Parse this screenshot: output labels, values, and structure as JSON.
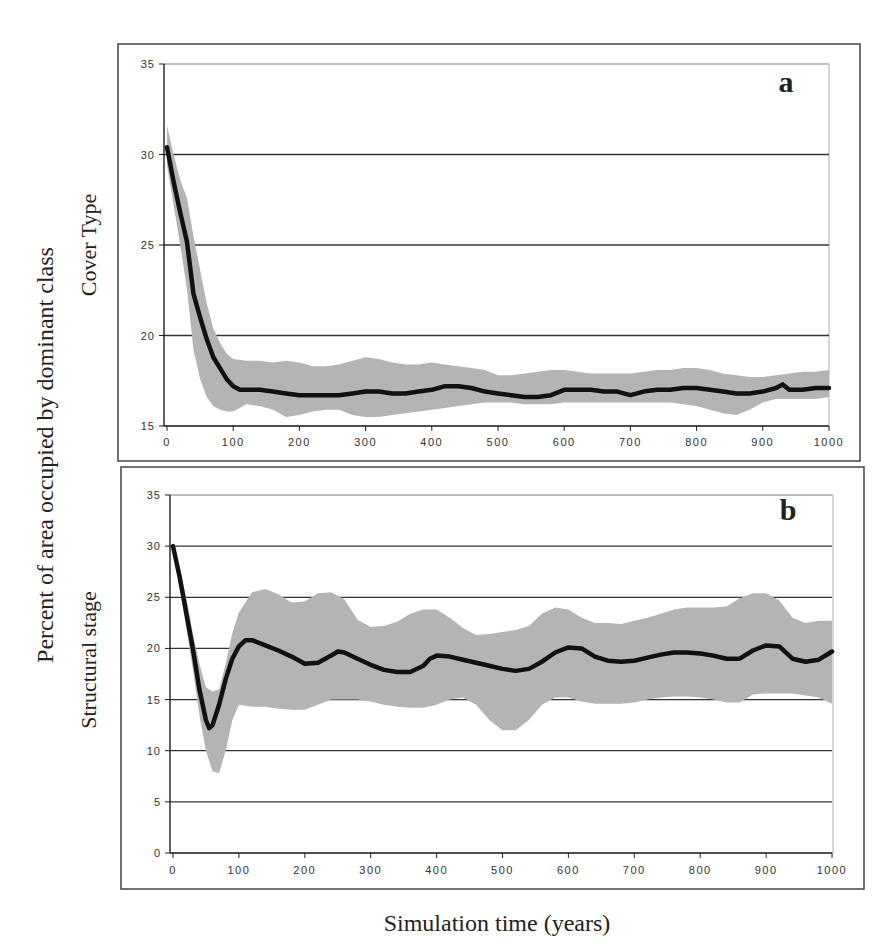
{
  "figure": {
    "shared_ylabel": "Percent of area occupied by dominant class",
    "shared_xlabel": "Simulation time (years)"
  },
  "colors": {
    "band": "#b4b4b4",
    "line": "#111111",
    "grid": "#333333",
    "frame": "#444444"
  },
  "chart_data": [
    {
      "type": "line",
      "panel_label": "a",
      "title": "",
      "xlabel": "Simulation time (years)",
      "ylabel": "Cover Type",
      "xlim": [
        0,
        1000
      ],
      "ylim": [
        15,
        35
      ],
      "xticks": [
        0,
        100,
        200,
        300,
        400,
        500,
        600,
        700,
        800,
        900,
        1000
      ],
      "yticks": [
        15,
        20,
        25,
        30,
        35
      ],
      "grid": "horizontal",
      "legend": "none",
      "series": [
        {
          "name": "mean",
          "x": [
            0,
            10,
            20,
            30,
            40,
            50,
            60,
            70,
            80,
            90,
            100,
            110,
            120,
            140,
            160,
            180,
            200,
            220,
            240,
            260,
            280,
            300,
            320,
            340,
            360,
            380,
            400,
            420,
            440,
            460,
            480,
            500,
            520,
            540,
            560,
            580,
            600,
            620,
            640,
            660,
            680,
            700,
            720,
            740,
            760,
            780,
            800,
            820,
            840,
            860,
            880,
            900,
            920,
            930,
            940,
            960,
            980,
            1000
          ],
          "values": [
            30.4,
            28.5,
            26.8,
            25.2,
            22.3,
            21.0,
            19.8,
            18.8,
            18.2,
            17.6,
            17.2,
            17.0,
            17.0,
            17.0,
            16.9,
            16.8,
            16.7,
            16.7,
            16.7,
            16.7,
            16.8,
            16.9,
            16.9,
            16.8,
            16.8,
            16.9,
            17.0,
            17.2,
            17.2,
            17.1,
            16.9,
            16.8,
            16.7,
            16.6,
            16.6,
            16.7,
            17.0,
            17.0,
            17.0,
            16.9,
            16.9,
            16.7,
            16.9,
            17.0,
            17.0,
            17.1,
            17.1,
            17.0,
            16.9,
            16.8,
            16.8,
            16.9,
            17.1,
            17.3,
            17.0,
            17.0,
            17.1,
            17.1
          ]
        },
        {
          "name": "upper_band",
          "x": [
            0,
            10,
            20,
            30,
            40,
            50,
            60,
            70,
            80,
            90,
            100,
            120,
            140,
            160,
            180,
            200,
            220,
            240,
            260,
            280,
            300,
            320,
            340,
            360,
            380,
            400,
            420,
            440,
            460,
            480,
            500,
            520,
            540,
            560,
            580,
            600,
            620,
            640,
            660,
            680,
            700,
            720,
            740,
            760,
            780,
            800,
            820,
            840,
            860,
            880,
            900,
            920,
            940,
            960,
            980,
            1000
          ],
          "values": [
            31.6,
            30.0,
            28.6,
            27.6,
            25.5,
            23.6,
            21.8,
            20.4,
            19.6,
            19.0,
            18.7,
            18.6,
            18.6,
            18.5,
            18.6,
            18.5,
            18.3,
            18.3,
            18.4,
            18.6,
            18.8,
            18.7,
            18.5,
            18.4,
            18.4,
            18.5,
            18.4,
            18.3,
            18.2,
            18.1,
            17.8,
            17.8,
            17.9,
            18.0,
            18.1,
            18.1,
            18.0,
            17.9,
            17.9,
            17.9,
            17.9,
            18.0,
            18.1,
            18.1,
            18.2,
            18.2,
            18.1,
            17.9,
            17.8,
            17.7,
            17.7,
            17.8,
            17.9,
            18.0,
            18.0,
            18.1
          ]
        },
        {
          "name": "lower_band",
          "x": [
            0,
            10,
            20,
            30,
            40,
            50,
            60,
            70,
            80,
            90,
            100,
            120,
            140,
            160,
            180,
            200,
            220,
            240,
            260,
            280,
            300,
            320,
            340,
            360,
            380,
            400,
            420,
            440,
            460,
            480,
            500,
            520,
            540,
            560,
            580,
            600,
            620,
            640,
            660,
            680,
            700,
            720,
            740,
            760,
            780,
            800,
            820,
            840,
            860,
            880,
            900,
            920,
            940,
            960,
            980,
            1000
          ],
          "values": [
            29.4,
            27.2,
            25.0,
            22.6,
            19.2,
            17.6,
            16.6,
            16.1,
            15.9,
            15.8,
            15.8,
            16.2,
            16.1,
            15.9,
            15.5,
            15.6,
            15.8,
            15.9,
            15.9,
            15.6,
            15.5,
            15.5,
            15.6,
            15.7,
            15.8,
            15.9,
            16.0,
            16.1,
            16.2,
            16.3,
            16.3,
            16.3,
            16.2,
            16.2,
            16.2,
            16.3,
            16.3,
            16.3,
            16.3,
            16.3,
            16.3,
            16.3,
            16.3,
            16.3,
            16.2,
            16.1,
            15.9,
            15.7,
            15.6,
            15.9,
            16.3,
            16.5,
            16.5,
            16.5,
            16.5,
            16.6
          ]
        }
      ]
    },
    {
      "type": "line",
      "panel_label": "b",
      "title": "",
      "xlabel": "Simulation time (years)",
      "ylabel": "Structural stage",
      "xlim": [
        0,
        1000
      ],
      "ylim": [
        0,
        35
      ],
      "xticks": [
        0,
        100,
        200,
        300,
        400,
        500,
        600,
        700,
        800,
        900,
        1000
      ],
      "yticks": [
        0,
        5,
        10,
        15,
        20,
        25,
        30,
        35
      ],
      "grid": "horizontal",
      "legend": "none",
      "series": [
        {
          "name": "mean",
          "x": [
            0,
            10,
            20,
            30,
            40,
            50,
            55,
            60,
            70,
            80,
            90,
            100,
            110,
            120,
            140,
            160,
            180,
            200,
            220,
            240,
            250,
            260,
            280,
            300,
            320,
            340,
            360,
            380,
            390,
            400,
            420,
            440,
            460,
            480,
            500,
            520,
            540,
            560,
            580,
            600,
            620,
            640,
            660,
            680,
            700,
            720,
            740,
            760,
            780,
            800,
            820,
            840,
            860,
            880,
            900,
            920,
            940,
            960,
            980,
            1000
          ],
          "values": [
            30.0,
            27.0,
            23.5,
            20.0,
            16.0,
            13.0,
            12.2,
            12.5,
            14.5,
            17.0,
            19.0,
            20.2,
            20.8,
            20.8,
            20.3,
            19.8,
            19.2,
            18.5,
            18.6,
            19.3,
            19.7,
            19.6,
            19.0,
            18.4,
            17.9,
            17.7,
            17.7,
            18.3,
            19.0,
            19.3,
            19.2,
            18.9,
            18.6,
            18.3,
            18.0,
            17.8,
            18.0,
            18.7,
            19.6,
            20.1,
            20.0,
            19.2,
            18.8,
            18.7,
            18.8,
            19.1,
            19.4,
            19.6,
            19.6,
            19.5,
            19.3,
            19.0,
            19.0,
            19.8,
            20.3,
            20.2,
            19.0,
            18.7,
            18.9,
            19.7
          ]
        },
        {
          "name": "upper_band",
          "x": [
            0,
            10,
            20,
            30,
            40,
            50,
            60,
            70,
            80,
            90,
            100,
            120,
            140,
            160,
            180,
            200,
            220,
            240,
            260,
            280,
            300,
            320,
            340,
            360,
            380,
            400,
            420,
            440,
            460,
            480,
            500,
            520,
            540,
            560,
            580,
            600,
            620,
            640,
            660,
            680,
            700,
            720,
            740,
            760,
            780,
            800,
            820,
            840,
            860,
            880,
            900,
            920,
            940,
            960,
            980,
            1000
          ],
          "values": [
            30.0,
            28.0,
            25.0,
            21.5,
            18.5,
            16.2,
            15.8,
            16.0,
            18.5,
            21.5,
            23.5,
            25.5,
            25.8,
            25.3,
            24.5,
            24.6,
            25.4,
            25.5,
            24.8,
            22.8,
            22.1,
            22.2,
            22.6,
            23.4,
            23.8,
            23.8,
            23.0,
            22.0,
            21.3,
            21.4,
            21.6,
            21.8,
            22.2,
            23.4,
            24.0,
            23.8,
            23.0,
            22.5,
            22.5,
            22.4,
            22.7,
            23.0,
            23.4,
            23.8,
            24.0,
            24.0,
            24.0,
            24.1,
            24.9,
            25.4,
            25.4,
            24.7,
            23.0,
            22.5,
            22.7,
            22.7
          ]
        },
        {
          "name": "lower_band",
          "x": [
            0,
            10,
            20,
            30,
            40,
            50,
            60,
            70,
            80,
            90,
            100,
            120,
            140,
            160,
            180,
            200,
            220,
            240,
            260,
            280,
            300,
            320,
            340,
            360,
            380,
            400,
            420,
            440,
            460,
            480,
            500,
            520,
            540,
            560,
            580,
            600,
            620,
            640,
            660,
            680,
            700,
            720,
            740,
            760,
            780,
            800,
            820,
            840,
            860,
            880,
            900,
            920,
            940,
            960,
            980,
            1000
          ],
          "values": [
            30.0,
            26.0,
            22.0,
            18.0,
            13.5,
            10.0,
            8.0,
            7.8,
            10.0,
            13.0,
            14.5,
            14.3,
            14.3,
            14.1,
            14.0,
            14.0,
            14.5,
            15.0,
            15.0,
            15.0,
            14.8,
            14.5,
            14.3,
            14.2,
            14.2,
            14.5,
            15.0,
            15.2,
            14.5,
            13.0,
            12.0,
            12.0,
            13.0,
            14.5,
            15.2,
            15.2,
            14.8,
            14.6,
            14.6,
            14.6,
            14.7,
            15.0,
            15.2,
            15.3,
            15.3,
            15.2,
            15.0,
            14.7,
            14.7,
            15.5,
            15.6,
            15.6,
            15.6,
            15.4,
            15.2,
            14.6
          ]
        }
      ]
    }
  ]
}
